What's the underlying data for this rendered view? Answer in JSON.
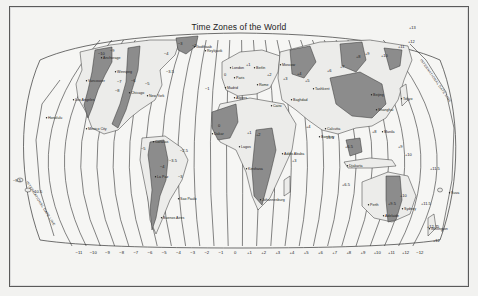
{
  "title": "Time Zones of the World",
  "colors": {
    "background": "#f4f4f2",
    "land_light": "#ededeb",
    "land_dark": "#8c8c8c",
    "lines": "#333333"
  },
  "date_line": {
    "west_label": "INTERNATIONAL DATE LINE",
    "east_label": "INTERNATIONAL DATE LINE"
  },
  "bottom_axis": [
    "−11",
    "−10",
    "−9",
    "−8",
    "−7",
    "−6",
    "−5",
    "−4",
    "−3",
    "−2",
    "−1",
    "0",
    "+1",
    "+2",
    "+3",
    "+4",
    "+5",
    "+6",
    "+7",
    "+8",
    "+9",
    "+10",
    "+11",
    "+12",
    "−12"
  ],
  "cities": [
    {
      "name": "Anchorage",
      "x": 103,
      "y": 59
    },
    {
      "name": "Vancouver",
      "x": 88,
      "y": 82
    },
    {
      "name": "Los Angeles",
      "x": 75,
      "y": 101
    },
    {
      "name": "Honolulu",
      "x": 48,
      "y": 119
    },
    {
      "name": "Mexico City",
      "x": 88,
      "y": 130
    },
    {
      "name": "Winnipeg",
      "x": 117,
      "y": 73
    },
    {
      "name": "Chicago",
      "x": 131,
      "y": 94
    },
    {
      "name": "New York",
      "x": 149,
      "y": 97
    },
    {
      "name": "Godthaab",
      "x": 196,
      "y": 48
    },
    {
      "name": "Reykjavik",
      "x": 207,
      "y": 52
    },
    {
      "name": "Caracas",
      "x": 155,
      "y": 143
    },
    {
      "name": "La Paz",
      "x": 157,
      "y": 178
    },
    {
      "name": "Sao Paulo",
      "x": 180,
      "y": 200
    },
    {
      "name": "Buenos Aires",
      "x": 163,
      "y": 219
    },
    {
      "name": "London",
      "x": 232,
      "y": 69
    },
    {
      "name": "Paris",
      "x": 236,
      "y": 79
    },
    {
      "name": "Berlin",
      "x": 256,
      "y": 69
    },
    {
      "name": "Madrid",
      "x": 227,
      "y": 89
    },
    {
      "name": "Rome",
      "x": 259,
      "y": 86
    },
    {
      "name": "Cairo",
      "x": 273,
      "y": 107
    },
    {
      "name": "Algiers",
      "x": 236,
      "y": 99
    },
    {
      "name": "Dakar",
      "x": 214,
      "y": 135
    },
    {
      "name": "Lagos",
      "x": 241,
      "y": 148
    },
    {
      "name": "Kinshasa",
      "x": 248,
      "y": 170
    },
    {
      "name": "Addis Ababa",
      "x": 284,
      "y": 155
    },
    {
      "name": "Johannesburg",
      "x": 262,
      "y": 201
    },
    {
      "name": "Moscow",
      "x": 282,
      "y": 66
    },
    {
      "name": "Baghdad",
      "x": 293,
      "y": 101
    },
    {
      "name": "Tashkent",
      "x": 315,
      "y": 90
    },
    {
      "name": "Calcutta",
      "x": 327,
      "y": 130
    },
    {
      "name": "Bombay",
      "x": 321,
      "y": 138
    },
    {
      "name": "Beijing",
      "x": 373,
      "y": 96
    },
    {
      "name": "Shanghai",
      "x": 378,
      "y": 111
    },
    {
      "name": "Tokyo",
      "x": 403,
      "y": 100
    },
    {
      "name": "Manila",
      "x": 384,
      "y": 133
    },
    {
      "name": "Djakarta",
      "x": 349,
      "y": 167
    },
    {
      "name": "Perth",
      "x": 370,
      "y": 206
    },
    {
      "name": "Adelaide",
      "x": 385,
      "y": 217
    },
    {
      "name": "Sydney",
      "x": 404,
      "y": 210
    },
    {
      "name": "Wellington",
      "x": 431,
      "y": 230
    },
    {
      "name": "Suva",
      "x": 451,
      "y": 194
    }
  ],
  "zone_labels": [
    {
      "t": "−10",
      "x": 98,
      "y": 55
    },
    {
      "t": "−9",
      "x": 110,
      "y": 52
    },
    {
      "t": "−8",
      "x": 115,
      "y": 92
    },
    {
      "t": "−7",
      "x": 117,
      "y": 83
    },
    {
      "t": "−6",
      "x": 131,
      "y": 82
    },
    {
      "t": "−5",
      "x": 145,
      "y": 85
    },
    {
      "t": "−4",
      "x": 164,
      "y": 55
    },
    {
      "t": "−3",
      "x": 178,
      "y": 45
    },
    {
      "t": "−3.5",
      "x": 166,
      "y": 73
    },
    {
      "t": "−2",
      "x": 192,
      "y": 47
    },
    {
      "t": "−1",
      "x": 205,
      "y": 90
    },
    {
      "t": "0",
      "x": 224,
      "y": 76
    },
    {
      "t": "+1",
      "x": 246,
      "y": 66
    },
    {
      "t": "+2",
      "x": 267,
      "y": 76
    },
    {
      "t": "+3",
      "x": 283,
      "y": 80
    },
    {
      "t": "+4",
      "x": 297,
      "y": 75
    },
    {
      "t": "+5",
      "x": 305,
      "y": 82
    },
    {
      "t": "+6",
      "x": 327,
      "y": 72
    },
    {
      "t": "+7",
      "x": 340,
      "y": 68
    },
    {
      "t": "+8",
      "x": 356,
      "y": 58
    },
    {
      "t": "+9",
      "x": 365,
      "y": 55
    },
    {
      "t": "+10",
      "x": 381,
      "y": 57
    },
    {
      "t": "+11",
      "x": 398,
      "y": 48
    },
    {
      "t": "+12",
      "x": 408,
      "y": 43
    },
    {
      "t": "+13",
      "x": 409,
      "y": 29
    },
    {
      "t": "−5",
      "x": 141,
      "y": 150
    },
    {
      "t": "−4",
      "x": 160,
      "y": 168
    },
    {
      "t": "−3",
      "x": 178,
      "y": 178
    },
    {
      "t": "−3.5",
      "x": 169,
      "y": 162
    },
    {
      "t": "−2.5",
      "x": 180,
      "y": 152
    },
    {
      "t": "0",
      "x": 218,
      "y": 127
    },
    {
      "t": "+1",
      "x": 247,
      "y": 134
    },
    {
      "t": "+2",
      "x": 256,
      "y": 136
    },
    {
      "t": "+3",
      "x": 292,
      "y": 162
    },
    {
      "t": "+4",
      "x": 306,
      "y": 128
    },
    {
      "t": "+5.5",
      "x": 326,
      "y": 139
    },
    {
      "t": "+6.5",
      "x": 345,
      "y": 148
    },
    {
      "t": "+8",
      "x": 372,
      "y": 133
    },
    {
      "t": "+9",
      "x": 398,
      "y": 148
    },
    {
      "t": "+10",
      "x": 405,
      "y": 156
    },
    {
      "t": "+11.5",
      "x": 430,
      "y": 170
    },
    {
      "t": "+9.5",
      "x": 388,
      "y": 205
    },
    {
      "t": "+10",
      "x": 400,
      "y": 197
    },
    {
      "t": "+11.5",
      "x": 421,
      "y": 205
    },
    {
      "t": "+12.75",
      "x": 427,
      "y": 228
    },
    {
      "t": "+12",
      "x": 433,
      "y": 242
    },
    {
      "t": "+6.5",
      "x": 342,
      "y": 186
    },
    {
      "t": "−9.5",
      "x": 13,
      "y": 182
    },
    {
      "t": "−10.5",
      "x": 32,
      "y": 193
    }
  ]
}
